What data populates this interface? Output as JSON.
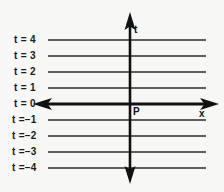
{
  "diagram": {
    "background_color": "#f7f7f5",
    "line_color": "#2b2b2b",
    "axis_color": "#111111",
    "axes": {
      "horizontal": {
        "name": "x",
        "label": "x",
        "label_x": 200,
        "label_y": 110,
        "y": 104,
        "x_start": 36,
        "x_end": 215,
        "thickness": 3,
        "arrow_left": true,
        "arrow_right": true
      },
      "vertical": {
        "name": "t",
        "label": "t",
        "label_x": 134,
        "label_y": 25,
        "x": 130,
        "y_start": 14,
        "y_end": 180,
        "thickness": 2.4,
        "arrow_up": true,
        "arrow_down": true
      }
    },
    "origin": {
      "label": "P",
      "x": 130,
      "y": 104,
      "label_x": 133,
      "label_y": 107
    },
    "line_x_start": 48,
    "line_x_end": 206,
    "levels": [
      {
        "label": "t = 4",
        "value": 4,
        "y": 40,
        "is_axis": false
      },
      {
        "label": "t = 3",
        "value": 3,
        "y": 56,
        "is_axis": false
      },
      {
        "label": "t = 2",
        "value": 2,
        "y": 72,
        "is_axis": false
      },
      {
        "label": "t = 1",
        "value": 1,
        "y": 88,
        "is_axis": false
      },
      {
        "label": "t = 0",
        "value": 0,
        "y": 104,
        "is_axis": true
      },
      {
        "label": "t =–1",
        "value": -1,
        "y": 120,
        "is_axis": false
      },
      {
        "label": "t =–2",
        "value": -2,
        "y": 136,
        "is_axis": false
      },
      {
        "label": "t =–3",
        "value": -3,
        "y": 152,
        "is_axis": false
      },
      {
        "label": "t =–4",
        "value": -4,
        "y": 168,
        "is_axis": false
      }
    ],
    "label_column_x": 14
  }
}
